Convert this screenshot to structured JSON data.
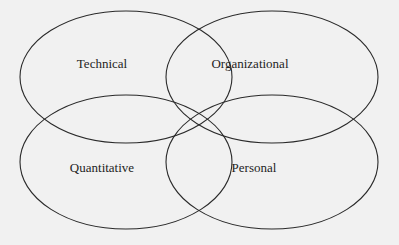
{
  "diagram": {
    "type": "venn",
    "stroke_color": "#2a2a2a",
    "background": "#f1f1f1",
    "sets": [
      {
        "label": "Technical",
        "cx": 126,
        "cy": 77,
        "rx": 106,
        "ry": 66,
        "label_x": 102,
        "label_y": 68
      },
      {
        "label": "Organizational",
        "cx": 272,
        "cy": 77,
        "rx": 106,
        "ry": 66,
        "label_x": 250,
        "label_y": 68
      },
      {
        "label": "Quantitative",
        "cx": 126,
        "cy": 162,
        "rx": 106,
        "ry": 67,
        "label_x": 102,
        "label_y": 168
      },
      {
        "label": "Personal",
        "cx": 272,
        "cy": 162,
        "rx": 106,
        "ry": 67,
        "label_x": 254,
        "label_y": 168
      }
    ]
  }
}
